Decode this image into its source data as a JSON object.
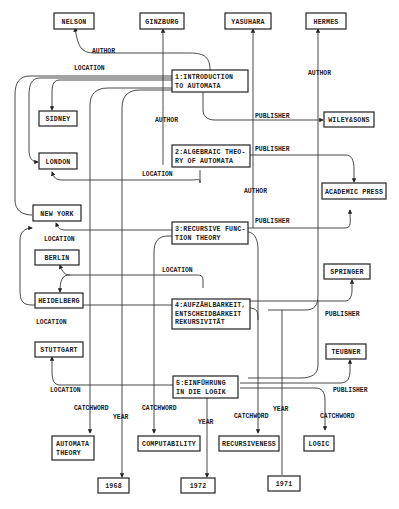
{
  "diagram": {
    "type": "semantic-network",
    "nodes": {
      "nelson": [
        "NELSON"
      ],
      "ginzburg": [
        "GINZBURG"
      ],
      "yasuhara": [
        "YASUHARA"
      ],
      "hermes": [
        "HERMES"
      ],
      "book1": [
        "1:INTRODUCTION",
        "TO AUTOMATA"
      ],
      "sidney": [
        "SIDNEY"
      ],
      "wiley": [
        "WILEY&SONS"
      ],
      "book2": [
        "2:ALGEBRAIC THEO-",
        "RY OF AUTOMATA"
      ],
      "london": [
        "LONDON"
      ],
      "academic": [
        "ACADEMIC PRESS"
      ],
      "newyork": [
        "NEW YORK"
      ],
      "book3": [
        "3:RECURSIVE FUNC-",
        "TION THEORY"
      ],
      "berlin": [
        "BERLIN"
      ],
      "heidelberg": [
        "HEIDELBERG"
      ],
      "springer": [
        "SPRINGER"
      ],
      "book4": [
        "4:AUFZÄHLBARKEIT,",
        "ENTSCHEIDBARKEIT",
        "REKURSIVITÄT"
      ],
      "stuttgart": [
        "STUTTGART"
      ],
      "teubner": [
        "TEUBNER"
      ],
      "book5": [
        "5:EINFÜHRUNG",
        "IN DIE LOGIK"
      ],
      "automata_theory": [
        "AUTOMATA",
        "THEORY"
      ],
      "computability": [
        "COMPUTABILITY"
      ],
      "recursiveness": [
        "RECURSIVENESS"
      ],
      "logic": [
        "LOGIC"
      ],
      "y1968": [
        "1968"
      ],
      "y1972": [
        "1972"
      ],
      "y1971": [
        "1971"
      ]
    },
    "edge_labels": {
      "author1": "AUTHOR",
      "location_top": "LOCATION",
      "author_ginzburg": "AUTHOR",
      "author_hermes": "AUTHOR",
      "publisher1": "PUBLISHER",
      "publisher2": "PUBLISHER",
      "location2": "LOCATION",
      "author_yasuhara": "AUTHOR",
      "publisher3": "PUBLISHER",
      "location3": "LOCATION",
      "location4_berlin": "LOCATION",
      "location4": "LOCATION",
      "publisher4": "PUBLISHER",
      "location5": "LOCATION",
      "publisher5": "PUBLISHER",
      "catchword1": "CATCHWORD",
      "catchword2": "CATCHWORD",
      "catchword3": "CATCHWORD",
      "catchword5": "CATCHWORD",
      "year1": "YEAR",
      "year2": "YEAR",
      "year3": "YEAR"
    }
  }
}
